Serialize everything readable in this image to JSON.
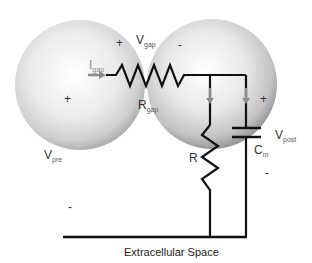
{
  "diagram": {
    "cells": [
      {
        "name": "presynaptic",
        "label_main": "V",
        "label_sub": "pre",
        "sign_inside_top": "+",
        "sign_inside_center": "+",
        "sign_outside": "-"
      },
      {
        "name": "postsynaptic",
        "label_main": "V",
        "label_sub": "post",
        "sign_top": "-",
        "sign_right": "+",
        "sign_below": "-"
      }
    ],
    "labels": {
      "v_gap_main": "V",
      "v_gap_sub": "gap",
      "v_gap_plus": "+",
      "v_gap_minus": "-",
      "i_gap_main": "I",
      "i_gap_sub": "gap",
      "r_gap_main": "R",
      "r_gap_sub": "gap",
      "r_main": "R",
      "cm_main": "C",
      "cm_sub": "m",
      "v_post_main": "V",
      "v_post_sub": "post",
      "v_pre_main": "V",
      "v_pre_sub": "pre",
      "pre_plus_top": "+",
      "pre_plus_center": "+",
      "post_minus_top": "-",
      "post_plus_right": "+",
      "post_minus_right": "-",
      "outside_minus_left": "-",
      "caption": "Extracellular Space"
    },
    "colors": {
      "wire": "#111111",
      "arrow": "#8c8c8c",
      "sphere_light": "#f4f4f4",
      "sphere_dark": "#9a9a9a",
      "text": "#333333"
    },
    "components": [
      "R_gap",
      "R",
      "C_m"
    ]
  }
}
